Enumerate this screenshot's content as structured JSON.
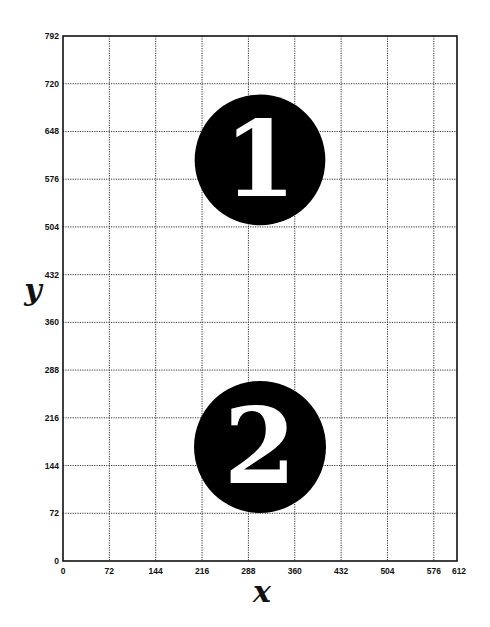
{
  "chart_data": {
    "type": "scatter",
    "title": "",
    "xlabel": "x",
    "ylabel": "y",
    "xlim": [
      0,
      612
    ],
    "ylim": [
      0,
      792
    ],
    "grid": true,
    "grid_style": "dotted",
    "x_ticks": [
      0,
      72,
      144,
      216,
      288,
      360,
      432,
      504,
      576,
      612
    ],
    "y_ticks": [
      0,
      72,
      144,
      216,
      288,
      360,
      432,
      504,
      576,
      648,
      720,
      792
    ],
    "x_tick_labels": [
      "0",
      "72",
      "144",
      "216",
      "288",
      "360",
      "432",
      "504",
      "576",
      "612"
    ],
    "y_tick_labels": [
      "0",
      "72",
      "144",
      "216",
      "288",
      "360",
      "432",
      "504",
      "576",
      "648",
      "720",
      "792"
    ],
    "x_gridlines": [
      72,
      144,
      216,
      288,
      360,
      432,
      504,
      576
    ],
    "y_gridlines": [
      72,
      144,
      216,
      288,
      360,
      432,
      504,
      576,
      648,
      720
    ],
    "markers": [
      {
        "label": "1",
        "x": 306,
        "y": 605,
        "radius": 100,
        "fill": "#000000",
        "text_color": "#ffffff"
      },
      {
        "label": "2",
        "x": 306,
        "y": 172,
        "radius": 101,
        "fill": "#000000",
        "text_color": "#ffffff"
      }
    ]
  },
  "colors": {
    "background": "#ffffff",
    "axis": "#111111",
    "grid": "#333333"
  }
}
